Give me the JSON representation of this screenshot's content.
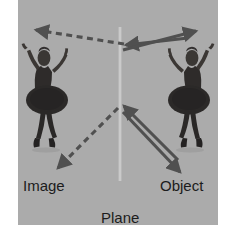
{
  "figure": {
    "kind": "physics-optics-diagram",
    "title_visible": false,
    "background_color": "#ffffff",
    "plate_color": "#a8a8a8",
    "ink_color": "#4a4a4a",
    "text_color": "#1c1c1c",
    "mirror_color": "#c9c9c9",
    "labels": {
      "image": "Image",
      "mirror_line1": "Plane",
      "mirror_line2": "mirror",
      "object": "Object"
    },
    "caption_sliver": "",
    "subjects": [
      {
        "name": "virtual-image-dancer",
        "side": "left",
        "description": "ballerina in dark tutu, arms raised, mirrored pose"
      },
      {
        "name": "object-dancer",
        "side": "right",
        "description": "ballerina in dark tutu, arms raised"
      }
    ],
    "rays": [
      {
        "name": "upper-incident-ray",
        "style": "solid",
        "from": "object-upper-arm",
        "to": "mirror-upper-point",
        "arrow": "toward-mirror"
      },
      {
        "name": "upper-reflected-ray",
        "style": "solid",
        "from": "mirror-upper-point",
        "to": "observer-upper-right",
        "arrow": "away-from-mirror"
      },
      {
        "name": "upper-virtual-ray",
        "style": "dashed",
        "from": "mirror-upper-point",
        "to": "image-upper-arm",
        "arrow": "toward-image"
      },
      {
        "name": "lower-incident-ray",
        "style": "solid",
        "from": "object-foot",
        "to": "mirror-lower-point",
        "arrow": "toward-mirror"
      },
      {
        "name": "lower-reflected-ray",
        "style": "solid",
        "from": "mirror-lower-point",
        "to": "observer-lower-right",
        "arrow": "away-from-mirror"
      },
      {
        "name": "lower-virtual-ray",
        "style": "dashed",
        "from": "mirror-lower-point",
        "to": "image-foot",
        "arrow": "toward-image"
      }
    ]
  }
}
